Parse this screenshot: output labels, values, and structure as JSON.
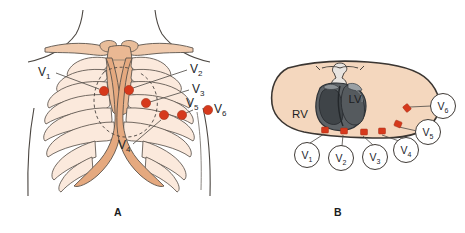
{
  "figure": {
    "panels": [
      {
        "id": "A",
        "letter": "A",
        "caption": "A",
        "view": "anterior chest wall with ribcage",
        "letter_pos": {
          "x": 118,
          "y": 216
        }
      },
      {
        "id": "B",
        "letter": "B",
        "caption": "B",
        "view": "transverse cross-section through thorax",
        "letter_pos": {
          "x": 338,
          "y": 216
        }
      }
    ]
  },
  "colors": {
    "electrode_red": "#d6391c",
    "electrode_red_dark": "#a5301a",
    "bone_light": "#fbe9dc",
    "bone_mid": "#edbb9a",
    "bone_dark": "#e0a77f",
    "skin_fill": "#f4d7be",
    "outline": "#3b3632",
    "heart_dark": "#4a4e52",
    "heart_mid": "#6d7276",
    "heart_light": "#9aa0a4",
    "text": "#22252b",
    "background": "#ffffff",
    "leader": "#55504c"
  },
  "panelA": {
    "name": "anterior-chest-view",
    "labels": [
      {
        "id": "v1",
        "text": "V",
        "sub": "1",
        "x": 38,
        "y": 76,
        "anchor": "start"
      },
      {
        "id": "v2",
        "text": "V",
        "sub": "2",
        "x": 190,
        "y": 73,
        "anchor": "start"
      },
      {
        "id": "v3",
        "text": "V",
        "sub": "3",
        "x": 192,
        "y": 93,
        "anchor": "start"
      },
      {
        "id": "v4",
        "text": "V",
        "sub": "4",
        "x": 118,
        "y": 149,
        "anchor": "start"
      },
      {
        "id": "v5",
        "text": "V",
        "sub": "5",
        "x": 186,
        "y": 107,
        "anchor": "start"
      },
      {
        "id": "v6",
        "text": "V",
        "sub": "6",
        "x": 214,
        "y": 113,
        "anchor": "start"
      }
    ],
    "electrodes": [
      {
        "id": "v1",
        "cx": 104,
        "cy": 91,
        "r": 4.6
      },
      {
        "id": "v2",
        "cx": 129,
        "cy": 90,
        "r": 4.6
      },
      {
        "id": "v3",
        "cx": 146,
        "cy": 103,
        "r": 4.6
      },
      {
        "id": "v4",
        "cx": 164,
        "cy": 115,
        "r": 4.6
      },
      {
        "id": "v5",
        "cx": 182,
        "cy": 115,
        "r": 4.6
      },
      {
        "id": "v6",
        "cx": 208,
        "cy": 110,
        "r": 4.6
      }
    ],
    "leaders": [
      {
        "id": "v1",
        "x1": 56,
        "y1": 73,
        "x2": 99,
        "y2": 89
      },
      {
        "id": "v2",
        "x1": 187,
        "y1": 70,
        "x2": 133,
        "y2": 88
      },
      {
        "id": "v3",
        "x1": 189,
        "y1": 90,
        "x2": 150,
        "y2": 102
      },
      {
        "id": "v4",
        "x1": 133,
        "y1": 144,
        "x2": 161,
        "y2": 120
      },
      {
        "id": "v5",
        "x1": 188,
        "y1": 110,
        "x2": 183,
        "y2": 111
      },
      {
        "id": "v6",
        "x1": 212,
        "y1": 110,
        "x2": 212,
        "y2": 110
      }
    ]
  },
  "panelB": {
    "name": "thorax-cross-section-view",
    "chambers": [
      {
        "id": "rv",
        "text": "RV",
        "x": 300,
        "y": 118
      },
      {
        "id": "lv",
        "text": "LV",
        "x": 355,
        "y": 103
      }
    ],
    "lead_circles": [
      {
        "id": "v1",
        "text": "V",
        "sub": "1",
        "cx": 307,
        "cy": 155,
        "r": 12.5
      },
      {
        "id": "v2",
        "text": "V",
        "sub": "2",
        "cx": 341,
        "cy": 158,
        "r": 12.5
      },
      {
        "id": "v3",
        "text": "V",
        "sub": "3",
        "cx": 375,
        "cy": 157,
        "r": 12.5
      },
      {
        "id": "v4",
        "text": "V",
        "sub": "4",
        "cx": 406,
        "cy": 150,
        "r": 12.5
      },
      {
        "id": "v5",
        "text": "V",
        "sub": "5",
        "cx": 428,
        "cy": 132,
        "r": 12.5
      },
      {
        "id": "v6",
        "text": "V",
        "sub": "6",
        "cx": 443,
        "cy": 106,
        "r": 12.5
      }
    ],
    "electrodes": [
      {
        "id": "v1",
        "cx": 325,
        "cy": 130,
        "w": 7,
        "h": 6
      },
      {
        "id": "v2",
        "cx": 344,
        "cy": 131,
        "w": 7,
        "h": 6
      },
      {
        "id": "v3",
        "cx": 364,
        "cy": 132,
        "w": 7,
        "h": 6
      },
      {
        "id": "v4",
        "cx": 382,
        "cy": 131,
        "w": 7,
        "h": 6
      },
      {
        "id": "v5",
        "cx": 398,
        "cy": 124,
        "w": 7,
        "h": 6
      },
      {
        "id": "v6",
        "cx": 407,
        "cy": 108,
        "w": 7,
        "h": 6
      }
    ],
    "leaders": [
      {
        "id": "v1",
        "x1": 324,
        "y1": 134,
        "x2": 310,
        "y2": 143
      },
      {
        "id": "v2",
        "x1": 343,
        "y1": 135,
        "x2": 342,
        "y2": 146
      },
      {
        "id": "v3",
        "x1": 363,
        "y1": 136,
        "x2": 373,
        "y2": 145
      },
      {
        "id": "v4",
        "x1": 382,
        "y1": 135,
        "x2": 399,
        "y2": 140
      },
      {
        "id": "v5",
        "x1": 399,
        "y1": 127,
        "x2": 417,
        "y2": 131
      },
      {
        "id": "v6",
        "x1": 410,
        "y1": 108,
        "x2": 430,
        "y2": 106
      }
    ]
  }
}
